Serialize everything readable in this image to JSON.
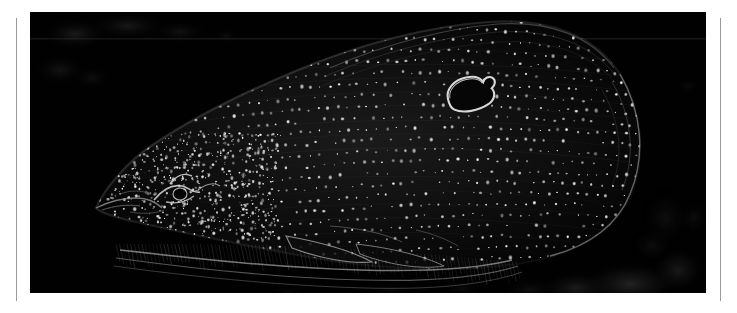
{
  "page": {
    "background_color": "#ffffff",
    "width": 737,
    "height": 313
  },
  "rules": {
    "color": "#9a9a9a",
    "left_x": 16,
    "right_x": 720,
    "top_y": 18,
    "height": 283
  },
  "plate": {
    "label": "dark-field micrograph of a fish",
    "background_color": "#010101",
    "x": 30,
    "y": 12,
    "width": 676,
    "height": 281
  },
  "subject": {
    "name": "fish",
    "description": "Dark-field / fluorescence style image of a laterally-oriented fish with a dense regular array of bright speckles covering the body, a bright outlined oval on the upper right flank, striated fin rays along the lower margin, and a tapering snout at the left.",
    "highlight_color": "#e8e8e8",
    "mid_tone_color": "#6a6a6a",
    "body_outline_color": "#2a2a2a"
  },
  "features": [
    {
      "name": "snout",
      "x": 95,
      "y": 195
    },
    {
      "name": "eye-region",
      "x": 165,
      "y": 185
    },
    {
      "name": "bright-oval-marking",
      "x": 445,
      "y": 85
    },
    {
      "name": "dorsal-ridge",
      "x": 450,
      "y": 25
    },
    {
      "name": "pectoral-fin",
      "x": 330,
      "y": 245
    },
    {
      "name": "ventral-fin-rays",
      "x": 250,
      "y": 265
    },
    {
      "name": "caudal-margin",
      "x": 625,
      "y": 150
    },
    {
      "name": "horizontal-scan-line",
      "y": 39
    },
    {
      "name": "background-haze-top-left",
      "x": 70,
      "y": 35
    },
    {
      "name": "background-haze-bottom-right",
      "x": 620,
      "y": 275
    }
  ]
}
